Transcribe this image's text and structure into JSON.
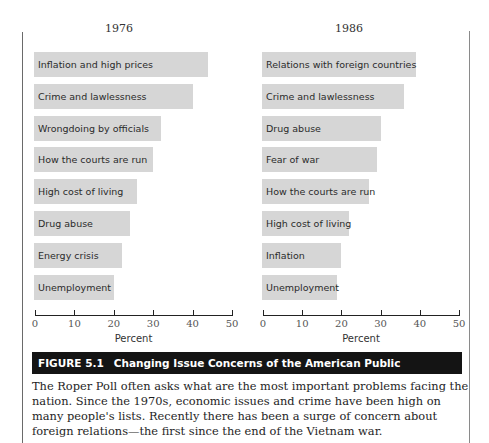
{
  "chart_data": [
    {
      "type": "bar",
      "orientation": "horizontal",
      "title": "1976",
      "xlabel": "Percent",
      "ylabel": "",
      "xlim": [
        0,
        50
      ],
      "xticks": [
        0,
        10,
        20,
        30,
        40,
        50
      ],
      "grid": false,
      "categories": [
        "Inflation and high prices",
        "Crime and lawlessness",
        "Wrongdoing by officials",
        "How the courts are run",
        "High cost of living",
        "Drug abuse",
        "Energy crisis",
        "Unemployment"
      ],
      "values": [
        44,
        40,
        32,
        30,
        26,
        24,
        22,
        20
      ]
    },
    {
      "type": "bar",
      "orientation": "horizontal",
      "title": "1986",
      "xlabel": "Percent",
      "ylabel": "",
      "xlim": [
        0,
        50
      ],
      "xticks": [
        0,
        10,
        20,
        30,
        40,
        50
      ],
      "grid": false,
      "categories": [
        "Relations with foreign countries",
        "Crime and lawlessness",
        "Drug abuse",
        "Fear of war",
        "How the courts are run",
        "High cost of living",
        "Inflation",
        "Unemployment"
      ],
      "values": [
        39,
        36,
        30,
        29,
        27,
        22,
        20,
        19
      ]
    }
  ],
  "figure": {
    "number": "FIGURE 5.1",
    "title": "Changing Issue Concerns of the American Public",
    "caption": "The Roper Poll often asks what are the most important problems facing the nation. Since the 1970s, economic issues and crime have been high on many people's lists. Recently there has been a surge of concern about foreign relations—the first since the end of the Vietnam war."
  },
  "colors": {
    "bar": "#d6d6d6",
    "banner": "#141414",
    "banner_text": "#ffffff"
  }
}
